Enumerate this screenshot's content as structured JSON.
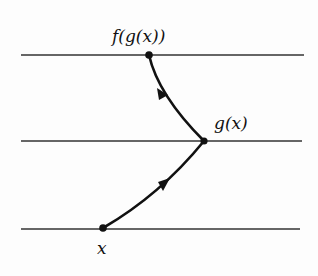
{
  "diagram": {
    "type": "function-composition",
    "lines": [
      {
        "name": "top-line",
        "y": 55,
        "x1": 21,
        "x2": 304
      },
      {
        "name": "middle-line",
        "y": 141,
        "x1": 21,
        "x2": 302
      },
      {
        "name": "bottom-line",
        "y": 229,
        "x1": 21,
        "x2": 300
      }
    ],
    "points": [
      {
        "name": "x",
        "label": "x",
        "cx": 103,
        "cy": 228
      },
      {
        "name": "g",
        "label": "g(x)",
        "cx": 204,
        "cy": 141
      },
      {
        "name": "fg",
        "label": "f(g(x))",
        "cx": 149,
        "cy": 55
      }
    ],
    "arrows": [
      {
        "from": "x",
        "to": "g(x)"
      },
      {
        "from": "g(x)",
        "to": "f(g(x))"
      }
    ],
    "colors": {
      "ink": "#111111",
      "line": "#333333"
    }
  }
}
